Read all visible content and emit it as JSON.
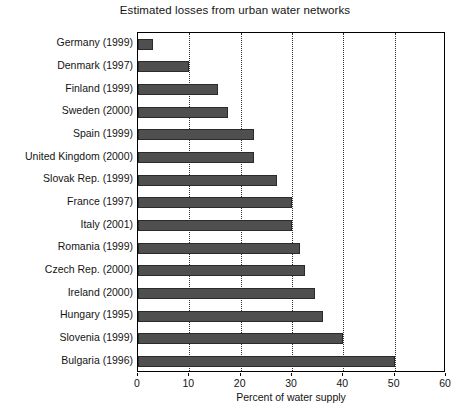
{
  "chart_data": {
    "type": "bar",
    "orientation": "horizontal",
    "title": "Estimated losses from urban water networks",
    "xlabel": "Percent of water supply",
    "ylabel": "",
    "xlim": [
      0,
      60
    ],
    "xticks": [
      0,
      10,
      20,
      30,
      40,
      50,
      60
    ],
    "xtick_labels": [
      "0",
      "10",
      "20",
      "30",
      "40",
      "50",
      "60"
    ],
    "grid": "vertical-dotted",
    "legend": "none",
    "bar_color": "#4f4f4f",
    "bar_edge_color": "#2a2a2a",
    "categories": [
      "Germany (1999)",
      "Denmark (1997)",
      "Finland (1999)",
      "Sweden (2000)",
      "Spain (1999)",
      "United Kingdom (2000)",
      "Slovak Rep. (1999)",
      "France (1997)",
      "Italy (2001)",
      "Romania (1999)",
      "Czech Rep. (2000)",
      "Ireland (2000)",
      "Hungary (1995)",
      "Slovenia (1999)",
      "Bulgaria (1996)"
    ],
    "values": [
      3,
      10,
      15.5,
      17.5,
      22.5,
      22.5,
      27,
      30,
      30,
      31.5,
      32.5,
      34.5,
      36,
      40,
      50
    ]
  }
}
